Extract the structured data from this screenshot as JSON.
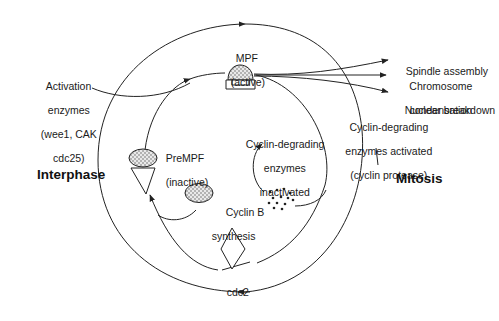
{
  "diagram": {
    "phases": {
      "interphase": "Interphase",
      "mitosis": "Mitosis"
    },
    "nodes": {
      "mpf": {
        "name": "MPF",
        "state": "(active)"
      },
      "prempf": {
        "name": "PreMPF",
        "state": "(inactive)"
      },
      "cyclin_b": {
        "line1": "Cyclin B",
        "line2": "synthesis"
      },
      "cdc2": "cdc2",
      "degrading_inactivated": {
        "line1": "Cyclin-degrading",
        "line2": "enzymes",
        "line3": "inactivated"
      },
      "degrading_activated": {
        "line1": "Cyclin-degrading",
        "line2": "enzymes activated",
        "line3": "(cyclin protease)"
      },
      "activation": {
        "line1": "Activation",
        "line2": "enzymes",
        "line3": "(wee1, CAK",
        "line4": "cdc25)"
      }
    },
    "outputs": [
      {
        "line1": "Spindle assembly"
      },
      {
        "line1": "Chromosome",
        "line2": "condensation"
      },
      {
        "line1": "Nuclear breakdown"
      }
    ],
    "colors": {
      "line": "#222222",
      "text": "#1a1a1a",
      "background": "#ffffff"
    }
  }
}
